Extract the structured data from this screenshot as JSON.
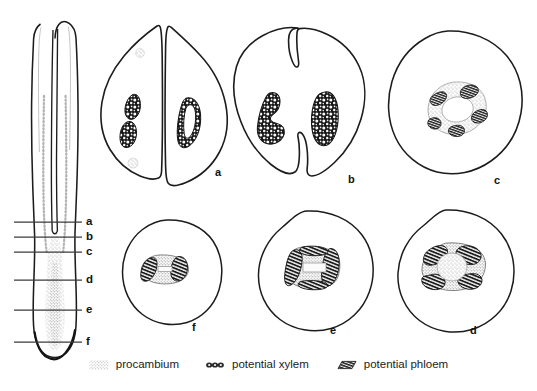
{
  "figure": {
    "background_color": "#ffffff",
    "ink_color": "#1a1a1a"
  },
  "habit_drawing": {
    "name": "longitudinal-embryo-drawing",
    "description": "longitudinal view of embryo with two elongate cotyledons and a root tip",
    "section_lines": [
      {
        "label": "a",
        "y": 222
      },
      {
        "label": "b",
        "y": 237
      },
      {
        "label": "c",
        "y": 252
      },
      {
        "label": "d",
        "y": 280
      },
      {
        "label": "e",
        "y": 310
      },
      {
        "label": "f",
        "y": 342
      }
    ]
  },
  "sections": [
    {
      "label": "a",
      "row": "top",
      "shape": "two-lobed cotyledons split by a deep median cleft",
      "label_x": 215,
      "label_y": 167
    },
    {
      "label": "b",
      "row": "top",
      "shape": "bilobed outline with notches at top and bottom",
      "label_x": 348,
      "label_y": 174
    },
    {
      "label": "c",
      "row": "top",
      "shape": "circular, ring of procambium around central pith",
      "label_x": 494,
      "label_y": 175
    },
    {
      "label": "f",
      "row": "bottom",
      "shape": "circular, small oval core",
      "label_x": 192,
      "label_y": 322
    },
    {
      "label": "e",
      "row": "bottom",
      "shape": "circular, rounded-square core",
      "label_x": 330,
      "label_y": 325
    },
    {
      "label": "d",
      "row": "bottom",
      "shape": "circular, oval core with radiating phloem",
      "label_x": 470,
      "label_y": 325
    }
  ],
  "legend": {
    "name": "tissue-legend",
    "items": [
      {
        "key": "procambium",
        "label": "procambium",
        "swatch": "stipple-swatch",
        "color": "#b9b9b9"
      },
      {
        "key": "potential_xylem",
        "label": "potential xylem",
        "swatch": "xylem-swatch",
        "color": "#2b2b2b"
      },
      {
        "key": "potential_phloem",
        "label": "potential phloem",
        "swatch": "phloem-swatch",
        "color": "#222222"
      }
    ]
  }
}
